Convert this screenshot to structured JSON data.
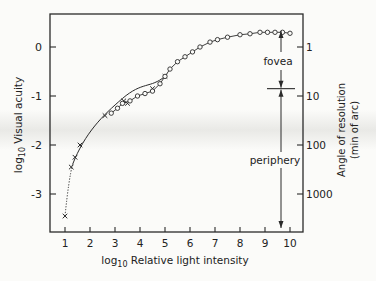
{
  "chart_data": {
    "type": "scatter",
    "title": "",
    "xlabel": "log10 Relative light intensity",
    "ylabel": "log10 Visual acuity",
    "y2label": "Angle of resolution (min of arc)",
    "xlim": [
      0.5,
      10.6
    ],
    "ylim": [
      -3.8,
      0.7
    ],
    "x_ticks": [
      1,
      2,
      3,
      4,
      5,
      6,
      7,
      8,
      9,
      10
    ],
    "y_ticks": [
      0,
      -1,
      -2,
      -3
    ],
    "y2_ticks": [
      {
        "value": 0,
        "label": "1"
      },
      {
        "value": -1,
        "label": "10"
      },
      {
        "value": -2,
        "label": "100"
      },
      {
        "value": -3,
        "label": "1000"
      }
    ],
    "grid": false,
    "series": [
      {
        "name": "periphery (crosses)",
        "marker": "x",
        "points": [
          [
            1.0,
            -3.45
          ],
          [
            1.25,
            -2.45
          ],
          [
            1.4,
            -2.25
          ],
          [
            1.6,
            -2.0
          ],
          [
            2.6,
            -1.4
          ],
          [
            3.35,
            -1.1
          ],
          [
            3.5,
            -1.15
          ],
          [
            4.5,
            -0.85
          ],
          [
            5.0,
            -0.6
          ]
        ]
      },
      {
        "name": "fovea (circles)",
        "marker": "o",
        "points": [
          [
            2.85,
            -1.35
          ],
          [
            3.1,
            -1.25
          ],
          [
            3.3,
            -1.15
          ],
          [
            3.6,
            -1.1
          ],
          [
            3.9,
            -1.0
          ],
          [
            4.2,
            -0.95
          ],
          [
            4.5,
            -0.9
          ],
          [
            4.8,
            -0.75
          ],
          [
            5.0,
            -0.6
          ],
          [
            5.2,
            -0.45
          ],
          [
            5.5,
            -0.3
          ],
          [
            5.8,
            -0.2
          ],
          [
            6.1,
            -0.1
          ],
          [
            6.4,
            0.0
          ],
          [
            6.8,
            0.1
          ],
          [
            7.1,
            0.15
          ],
          [
            7.5,
            0.2
          ],
          [
            8.0,
            0.25
          ],
          [
            8.4,
            0.27
          ],
          [
            8.8,
            0.3
          ],
          [
            9.1,
            0.3
          ],
          [
            9.4,
            0.3
          ],
          [
            9.7,
            0.3
          ],
          [
            10.0,
            0.28
          ]
        ]
      }
    ],
    "annotations": [
      {
        "text": "fovea",
        "x": 9.4,
        "y": -0.35
      },
      {
        "text": "periphery",
        "x": 9.4,
        "y": -2.1
      }
    ],
    "boundary_y": -0.85
  },
  "labels": {
    "xlabel_pre": "log",
    "xlabel_sub": "10",
    "xlabel_post": " Relative light intensity",
    "ylabel_pre": "log",
    "ylabel_sub": "10",
    "ylabel_post": " Visual acuity",
    "y2label_line1": "Angle of resolution",
    "y2label_line2": "(min of arc)",
    "fovea": "fovea",
    "periphery": "periphery"
  }
}
